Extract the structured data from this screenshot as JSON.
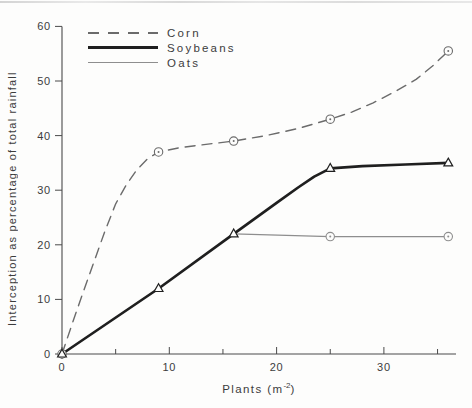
{
  "chart_data": {
    "type": "line",
    "title": "",
    "xlabel": "Plants (m⁻²)",
    "xlabel_parts": {
      "prefix": "Plants (m",
      "sup": "-2",
      "suffix": ")"
    },
    "ylabel": "Interception as percentage of total rainfall",
    "xlim": [
      0,
      37
    ],
    "ylim": [
      0,
      60
    ],
    "x_major_ticks": [
      0,
      10,
      20,
      30
    ],
    "x_minor_ticks": [
      5,
      15,
      25,
      35
    ],
    "y_ticks": [
      0,
      10,
      20,
      30,
      40,
      50,
      60
    ],
    "grid": false,
    "legend_position": "top-left",
    "axis_color": "#4a4a4a",
    "text_color": "#3c3c3c",
    "series": [
      {
        "name": "Corn",
        "line_style": "dashed",
        "marker": "circle-dot",
        "color": "#6b6b6b",
        "stroke_width": 1.4,
        "points": [
          [
            0,
            0
          ],
          [
            9,
            37
          ],
          [
            16,
            39
          ],
          [
            25,
            43
          ],
          [
            36,
            55.5
          ]
        ],
        "curve": [
          [
            0,
            0
          ],
          [
            1,
            5.8
          ],
          [
            2,
            11.5
          ],
          [
            3,
            17
          ],
          [
            4,
            22.5
          ],
          [
            5,
            27.5
          ],
          [
            6,
            31
          ],
          [
            7,
            33.8
          ],
          [
            8,
            35.8
          ],
          [
            9,
            37
          ],
          [
            11,
            37.8
          ],
          [
            13,
            38.3
          ],
          [
            16,
            39
          ],
          [
            19,
            40
          ],
          [
            22,
            41.3
          ],
          [
            25,
            43
          ],
          [
            27,
            44.3
          ],
          [
            29,
            46
          ],
          [
            31,
            48
          ],
          [
            33,
            50.3
          ],
          [
            34.5,
            52.7
          ],
          [
            36,
            55.5
          ]
        ]
      },
      {
        "name": "Soybeans",
        "line_style": "solid-thick",
        "marker": "triangle",
        "color": "#1f1f1f",
        "stroke_width": 2.7,
        "points": [
          [
            0,
            0
          ],
          [
            9,
            12
          ],
          [
            16,
            22
          ],
          [
            25,
            34
          ],
          [
            36,
            35
          ]
        ],
        "curve": [
          [
            0,
            0
          ],
          [
            9,
            12
          ],
          [
            16,
            22
          ],
          [
            20,
            27.7
          ],
          [
            22,
            30.5
          ],
          [
            23.5,
            32.5
          ],
          [
            25,
            34
          ],
          [
            28,
            34.4
          ],
          [
            32,
            34.7
          ],
          [
            36,
            35
          ]
        ]
      },
      {
        "name": "Oats",
        "line_style": "solid-thin",
        "marker": "circle-dot",
        "color": "#8e8e8e",
        "stroke_width": 1.1,
        "points": [
          [
            25,
            21.5
          ],
          [
            36,
            21.5
          ]
        ],
        "curve": [
          [
            16,
            22
          ],
          [
            25,
            21.5
          ],
          [
            36,
            21.5
          ]
        ]
      }
    ]
  }
}
